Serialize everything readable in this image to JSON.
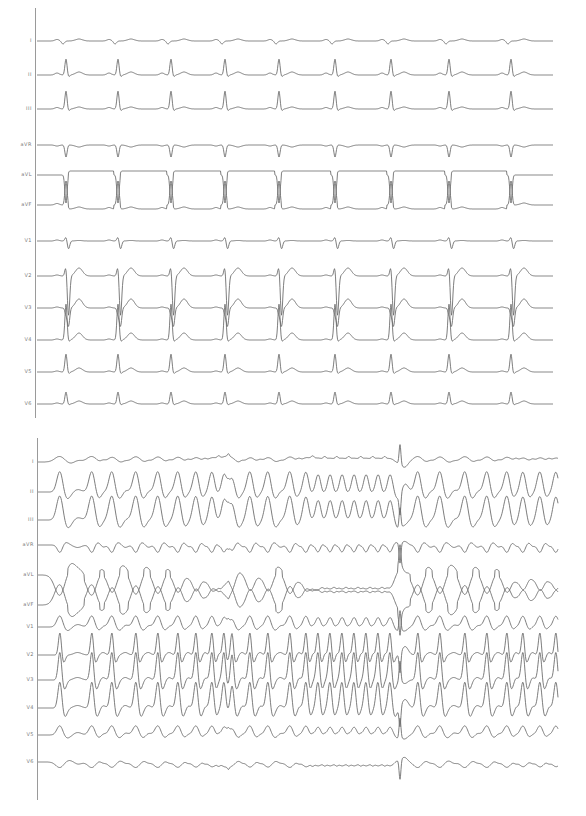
{
  "figure": {
    "panels": [
      {
        "id": "top",
        "description": "12-lead ECG, sinus rhythm with short PR and wide QRS",
        "axis_x": 35,
        "axis_top": 8,
        "axis_bottom": 418,
        "trace_start": 37,
        "trace_end": 553,
        "beats_x": [
          65,
          117,
          170,
          224,
          278,
          334,
          390,
          448,
          510
        ],
        "leads": [
          {
            "label": "I",
            "baseline": 41,
            "type": "I"
          },
          {
            "label": "II",
            "baseline": 75,
            "type": "II"
          },
          {
            "label": "III",
            "baseline": 109,
            "type": "III"
          },
          {
            "label": "aVR",
            "baseline": 145,
            "type": "aVR"
          },
          {
            "label": "aVL",
            "baseline": 175,
            "type": "aVL"
          },
          {
            "label": "aVF",
            "baseline": 205,
            "type": "aVF"
          },
          {
            "label": "V1",
            "baseline": 241,
            "type": "V1"
          },
          {
            "label": "V2",
            "baseline": 276,
            "type": "V2"
          },
          {
            "label": "V3",
            "baseline": 308,
            "type": "V3"
          },
          {
            "label": "V4",
            "baseline": 340,
            "type": "V4"
          },
          {
            "label": "V5",
            "baseline": 372,
            "type": "V5"
          },
          {
            "label": "V6",
            "baseline": 404,
            "type": "V6"
          }
        ]
      },
      {
        "id": "bottom",
        "description": "12-lead ECG, wide complex tachycardia terminating around the spike artifact",
        "axis_x": 37,
        "axis_top": 438,
        "axis_bottom": 800,
        "trace_start": 38,
        "trace_end": 558,
        "artifact_x": 400,
        "leads": [
          {
            "label": "I",
            "baseline": 462,
            "type": "I"
          },
          {
            "label": "II",
            "baseline": 492,
            "type": "II"
          },
          {
            "label": "III",
            "baseline": 520,
            "type": "III"
          },
          {
            "label": "aVR",
            "baseline": 545,
            "type": "aVR"
          },
          {
            "label": "aVL",
            "baseline": 575,
            "type": "aVL"
          },
          {
            "label": "aVF",
            "baseline": 605,
            "type": "aVF"
          },
          {
            "label": "V1",
            "baseline": 627,
            "type": "V1"
          },
          {
            "label": "V2",
            "baseline": 655,
            "type": "V2"
          },
          {
            "label": "V3",
            "baseline": 680,
            "type": "V3"
          },
          {
            "label": "V4",
            "baseline": 708,
            "type": "V4"
          },
          {
            "label": "V5",
            "baseline": 735,
            "type": "V5"
          },
          {
            "label": "V6",
            "baseline": 762,
            "type": "V6"
          }
        ],
        "beats_x": [
          60,
          92,
          112,
          136,
          158,
          178,
          196,
          212,
          224,
          232,
          250,
          268,
          290,
          306,
          318,
          330,
          342,
          354,
          366,
          378,
          390,
          418,
          440,
          465,
          487,
          507,
          523,
          540,
          556
        ]
      }
    ],
    "colors": {
      "trace": "#6e6e6e",
      "axis": "#9a9a9a",
      "label": "#7a7a7a",
      "background": "#ffffff"
    }
  }
}
